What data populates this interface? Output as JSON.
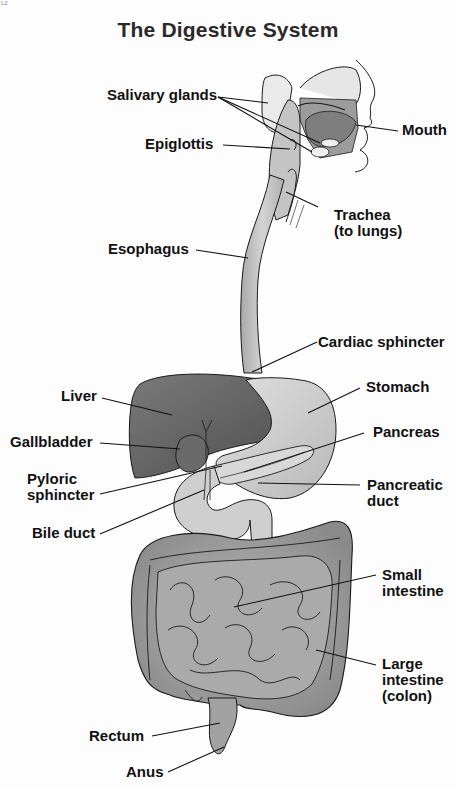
{
  "diagram": {
    "title": "The Digestive System",
    "corner_mark": "L2",
    "labels": [
      {
        "id": "salivary-glands",
        "text": "Salivary glands"
      },
      {
        "id": "mouth",
        "text": "Mouth"
      },
      {
        "id": "epiglottis",
        "text": "Epiglottis"
      },
      {
        "id": "trachea",
        "line1": "Trachea",
        "line2": "(to lungs)"
      },
      {
        "id": "esophagus",
        "text": "Esophagus"
      },
      {
        "id": "cardiac-sphincter",
        "text": "Cardiac sphincter"
      },
      {
        "id": "liver",
        "text": "Liver"
      },
      {
        "id": "stomach",
        "text": "Stomach"
      },
      {
        "id": "gallbladder",
        "text": "Gallbladder"
      },
      {
        "id": "pancreas",
        "text": "Pancreas"
      },
      {
        "id": "pyloric-sphincter",
        "line1": "Pyloric",
        "line2": "sphincter"
      },
      {
        "id": "pancreatic-duct",
        "line1": "Pancreatic",
        "line2": "duct"
      },
      {
        "id": "bile-duct",
        "text": "Bile duct"
      },
      {
        "id": "small-intestine",
        "line1": "Small",
        "line2": "intestine"
      },
      {
        "id": "large-intestine",
        "line1": "Large",
        "line2": "intestine",
        "line3": "(colon)"
      },
      {
        "id": "rectum",
        "text": "Rectum"
      },
      {
        "id": "anus",
        "text": "Anus"
      }
    ],
    "colors": {
      "liver": "#5e5e5e",
      "stomach": "#c9c9c9",
      "intestine": "#9a9a9a",
      "esophagus": "#b8b8b8",
      "outline": "#1a1a1a",
      "background": "#fdfdfd"
    }
  }
}
